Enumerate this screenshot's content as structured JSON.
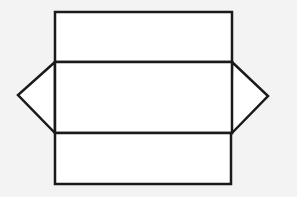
{
  "diagram": {
    "title": "",
    "colors": {
      "background": "#f3f3f3",
      "fill": "#ffffff",
      "stroke": "#1a1a1a"
    },
    "stroke_width": 2.5,
    "shapes": {
      "top_rect": {
        "x": 55,
        "y": 12,
        "w": 177,
        "h": 50
      },
      "middle_rect": {
        "x": 55,
        "y": 62,
        "w": 177,
        "h": 71
      },
      "bottom_rect": {
        "x": 55,
        "y": 133,
        "w": 176,
        "h": 51
      },
      "left_triangle": {
        "points": "55,62 18,95 55,133"
      },
      "right_triangle": {
        "points": "232,62 268,96 231,134"
      }
    }
  }
}
